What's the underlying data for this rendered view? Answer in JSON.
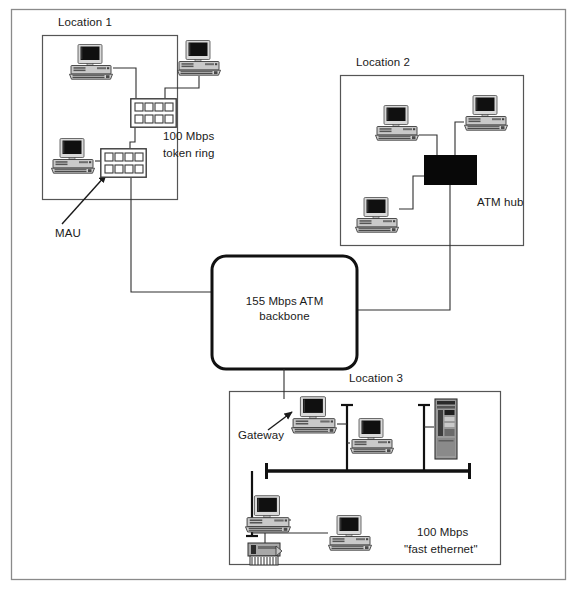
{
  "diagram": {
    "background_color": "#ffffff",
    "line_color": "#1a1a1a",
    "frame": {
      "name": "outer-frame",
      "x": 11,
      "y": 9,
      "width": 555,
      "height": 571,
      "stroke": "#777777"
    },
    "locations": [
      {
        "id": "location-1",
        "label": "Location 1",
        "label_x": 58,
        "label_y": 22,
        "box": {
          "x": 42,
          "y": 35,
          "width": 136,
          "height": 165
        }
      },
      {
        "id": "location-2",
        "label": "Location 2",
        "label_x": 356,
        "label_y": 62,
        "box": {
          "x": 340,
          "y": 75,
          "width": 184,
          "height": 171
        }
      },
      {
        "id": "location-3",
        "label": "Location 3",
        "label_x": 349,
        "label_y": 378,
        "box": {
          "x": 229,
          "y": 391,
          "width": 272,
          "height": 174
        }
      }
    ],
    "backbone": {
      "id": "atm-backbone",
      "label_line1": "155 Mbps ATM",
      "label_line2": "backbone",
      "x": 212,
      "y": 256,
      "width": 145,
      "height": 113,
      "radius": 14,
      "stroke_width": 3
    },
    "network_labels": [
      {
        "id": "token-ring-label",
        "line1": "100 Mbps",
        "line2": "token ring",
        "x": 163,
        "y": 136
      },
      {
        "id": "atm-hub-label",
        "line1": "ATM hub",
        "line2": "",
        "x": 477,
        "y": 200
      },
      {
        "id": "fast-ethernet-label",
        "line1": "100 Mbps",
        "line2": "\"fast ethernet\"",
        "x": 453,
        "y": 531
      }
    ],
    "callouts": [
      {
        "id": "mau-callout",
        "label": "MAU",
        "label_x": 55,
        "label_y": 230,
        "arrow": {
          "x1": 63,
          "y1": 224,
          "x2": 105,
          "y2": 175
        }
      },
      {
        "id": "gateway-callout",
        "label": "Gateway",
        "label_x": 238,
        "label_y": 431,
        "arrow": {
          "x1": 268,
          "y1": 430,
          "x2": 294,
          "y2": 413
        }
      }
    ],
    "devices": [
      {
        "id": "pc-loc1-top-left",
        "type": "desktop-computer",
        "x": 69,
        "y": 44,
        "w": 44,
        "h": 36
      },
      {
        "id": "pc-loc1-top-right",
        "type": "desktop-computer",
        "x": 177,
        "y": 40,
        "w": 44,
        "h": 36
      },
      {
        "id": "pc-loc1-bottom",
        "type": "desktop-computer",
        "x": 51,
        "y": 138,
        "w": 44,
        "h": 36
      },
      {
        "id": "mau-upper",
        "type": "mau-hub",
        "x": 130,
        "y": 98,
        "w": 47,
        "h": 30
      },
      {
        "id": "mau-lower",
        "type": "mau-hub",
        "x": 100,
        "y": 148,
        "w": 47,
        "h": 30
      },
      {
        "id": "pc-loc2-left",
        "type": "desktop-computer",
        "x": 375,
        "y": 105,
        "w": 44,
        "h": 36
      },
      {
        "id": "pc-loc2-right",
        "type": "desktop-computer",
        "x": 464,
        "y": 95,
        "w": 44,
        "h": 36
      },
      {
        "id": "pc-loc2-bottom",
        "type": "desktop-computer",
        "x": 355,
        "y": 197,
        "w": 44,
        "h": 36
      },
      {
        "id": "atm-hub",
        "type": "atm-hub-box",
        "x": 424,
        "y": 155,
        "w": 53,
        "h": 30
      },
      {
        "id": "pc-loc3-gateway",
        "type": "desktop-computer",
        "x": 291,
        "y": 396,
        "w": 46,
        "h": 38
      },
      {
        "id": "pc-loc3-mid",
        "type": "desktop-computer",
        "x": 350,
        "y": 418,
        "w": 44,
        "h": 36
      },
      {
        "id": "server-loc3",
        "type": "tower-server",
        "x": 434,
        "y": 398,
        "w": 24,
        "h": 62
      },
      {
        "id": "pc-loc3-lower-left",
        "type": "desktop-computer",
        "x": 245,
        "y": 495,
        "w": 46,
        "h": 38
      },
      {
        "id": "pc-loc3-lower-mid",
        "type": "desktop-computer",
        "x": 328,
        "y": 515,
        "w": 44,
        "h": 36
      },
      {
        "id": "printer-loc3",
        "type": "printer",
        "x": 246,
        "y": 540,
        "w": 38,
        "h": 28
      }
    ],
    "ethernet_bus": {
      "id": "fast-ethernet-bus",
      "x1": 266,
      "x2": 470,
      "y": 471,
      "stroke_width": 3.5,
      "terminator_height": 16
    }
  }
}
